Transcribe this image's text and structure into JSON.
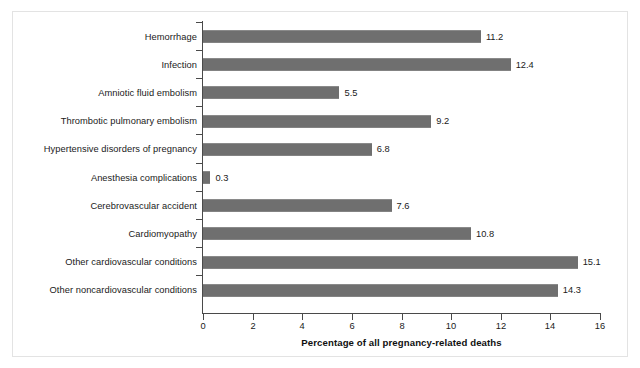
{
  "chart_data": {
    "type": "bar",
    "orientation": "horizontal",
    "title": "",
    "xlabel": "Percentage of all pregnancy-related deaths",
    "ylabel": "",
    "xlim": [
      0,
      16
    ],
    "xticks": [
      0,
      2,
      4,
      6,
      8,
      10,
      12,
      14,
      16
    ],
    "grid": false,
    "legend": null,
    "bar_color": "#7b7b7b",
    "categories": [
      "Hemorrhage",
      "Infection",
      "Amniotic fluid embolism",
      "Thrombotic pulmonary embolism",
      "Hypertensive disorders of pregnancy",
      "Anesthesia complications",
      "Cerebrovascular accident",
      "Cardiomyopathy",
      "Other cardiovascular conditions",
      "Other noncardiovascular conditions"
    ],
    "values": [
      11.2,
      12.4,
      5.5,
      9.2,
      6.8,
      0.3,
      7.6,
      10.8,
      15.1,
      14.3
    ],
    "value_labels": [
      "11.2",
      "12.4",
      "5.5",
      "9.2",
      "6.8",
      "0.3",
      "7.6",
      "10.8",
      "15.1",
      "14.3"
    ],
    "xtick_labels": [
      "0",
      "2",
      "4",
      "6",
      "8",
      "10",
      "12",
      "14",
      "16"
    ]
  }
}
